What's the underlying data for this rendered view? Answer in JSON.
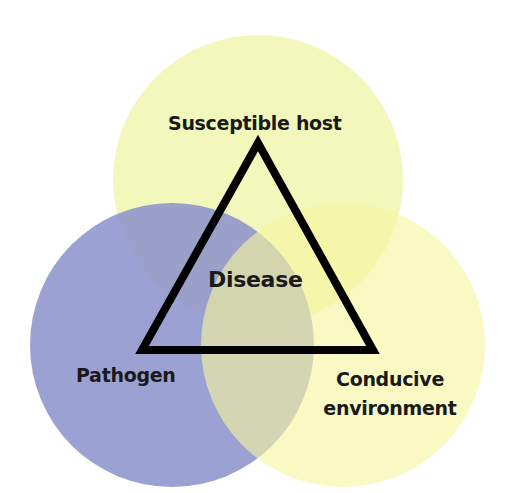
{
  "diagram": {
    "center_label": "Disease",
    "corners": [
      {
        "id": "host",
        "label": "Susceptible host"
      },
      {
        "id": "pathogen",
        "label": "Pathogen"
      },
      {
        "id": "environment",
        "label_line1": "Conducive",
        "label_line2": "environment"
      }
    ],
    "circles": [
      {
        "id": "host",
        "color": "#f1f6b4"
      },
      {
        "id": "pathogen",
        "color": "#8b90cb"
      },
      {
        "id": "environment",
        "color": "#f7f5a0"
      }
    ],
    "triangle_color": "#000000"
  }
}
